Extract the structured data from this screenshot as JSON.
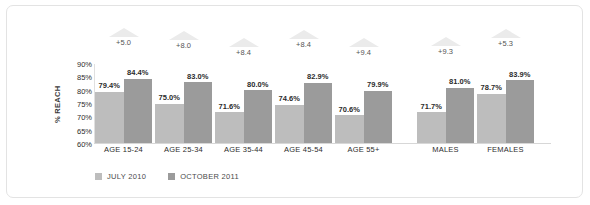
{
  "chart_data": {
    "type": "bar",
    "title": "",
    "subtitle": "",
    "xlabel": "",
    "ylabel": "% REACH",
    "ylim": [
      60,
      90
    ],
    "ytick_labels": [
      "90%",
      "85%",
      "80%",
      "75%",
      "70%",
      "65%",
      "60%"
    ],
    "ytick_values": [
      90,
      85,
      80,
      75,
      70,
      65,
      60
    ],
    "grid": false,
    "legend_position": "bottom-left",
    "categories": [
      "AGE 15-24",
      "AGE 25-34",
      "AGE 35-44",
      "AGE 45-54",
      "AGE 55+",
      "MALES",
      "FEMALES"
    ],
    "series": [
      {
        "name": "JULY 2010",
        "color": "#bdbdbd",
        "values": [
          79.4,
          75.0,
          71.6,
          74.6,
          70.6,
          71.7,
          78.7
        ],
        "value_labels": [
          "79.4%",
          "75.0%",
          "71.6%",
          "74.6%",
          "70.6%",
          "71.7%",
          "78.7%"
        ]
      },
      {
        "name": "OCTOBER 2011",
        "color": "#9b9b9b",
        "values": [
          84.4,
          83.0,
          80.0,
          82.9,
          79.9,
          81.0,
          83.9
        ],
        "value_labels": [
          "84.4%",
          "83.0%",
          "80.0%",
          "82.9%",
          "79.9%",
          "81.0%",
          "83.9%"
        ]
      }
    ],
    "annotations": {
      "type": "up-arrow-delta",
      "values": [
        5.0,
        8.0,
        8.4,
        8.4,
        9.4,
        9.3,
        5.3
      ],
      "labels": [
        "+5.0",
        "+8.0",
        "+8.4",
        "+8.4",
        "+9.4",
        "+9.3",
        "+5.3"
      ]
    }
  },
  "legend": [
    {
      "label": "JULY 2010",
      "color": "#bdbdbd"
    },
    {
      "label": "OCTOBER 2011",
      "color": "#9b9b9b"
    }
  ],
  "colors": {
    "series_july": "#bdbdbd",
    "series_october": "#9b9b9b",
    "arrow": "#ebebeb",
    "border": "#e3e3e3",
    "text": "#2d2d2d",
    "background": "#ffffff"
  }
}
